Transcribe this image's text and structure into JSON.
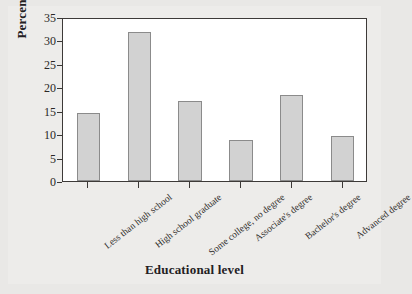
{
  "chart_data": {
    "type": "bar",
    "title": "",
    "xlabel": "Educational level",
    "ylabel": "Percentage",
    "categories": [
      "Less than high school",
      "High school graduate",
      "Some college, no degree",
      "Associate's degree",
      "Bachelor's degree",
      "Advanced degree"
    ],
    "values": [
      14.5,
      31.8,
      17.1,
      8.8,
      18.4,
      9.7
    ],
    "ylim": [
      0,
      35
    ],
    "yticks": [
      0,
      5,
      10,
      15,
      20,
      25,
      30,
      35
    ],
    "ytick_labels": [
      "0",
      "5",
      "10",
      "15",
      "20",
      "25",
      "30",
      "35"
    ],
    "grid": false,
    "legend": false,
    "legend_position": "none",
    "bar_fill_color": "#d2d2d2",
    "bar_edge_color": "#8b8b8b",
    "frame_color": "#3d3a38",
    "plot_background": "#ffffff",
    "figure_background": "#e9e8e6"
  }
}
